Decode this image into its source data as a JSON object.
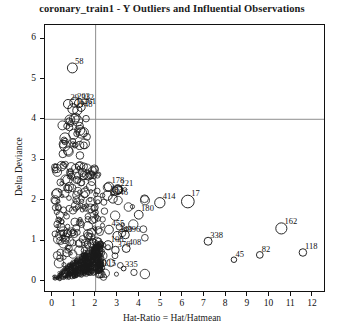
{
  "chart_data": {
    "type": "scatter",
    "title": "coronary_train1 - Y Outliers and Influential Observations",
    "xlabel": "Hat-Ratio = Hat/Hatmean",
    "ylabel": "Delta Deviance",
    "xlim": [
      -0.35,
      12.6
    ],
    "ylim": [
      -0.28,
      6.35
    ],
    "xticks": [
      0,
      1,
      2,
      3,
      4,
      5,
      6,
      7,
      8,
      9,
      10,
      11,
      12
    ],
    "yticks": [
      0,
      1,
      2,
      3,
      4,
      5,
      6
    ],
    "grid": false,
    "legend": "none",
    "marker": "open-circle",
    "reference_lines": [
      {
        "name": "hat-ratio-threshold",
        "orientation": "vertical",
        "value": 2,
        "color": "#8c8c8c"
      },
      {
        "name": "delta-deviance-threshold",
        "orientation": "horizontal",
        "value": 4,
        "color": "#8c8c8c"
      }
    ],
    "labeled_points": [
      {
        "label": "58",
        "x": 0.92,
        "y": 5.28,
        "r": 5.0
      },
      {
        "label": "29",
        "x": 0.72,
        "y": 4.38,
        "r": 4.6
      },
      {
        "label": "203",
        "x": 1.02,
        "y": 4.42,
        "r": 4.8
      },
      {
        "label": "312",
        "x": 1.22,
        "y": 4.4,
        "r": 4.4
      },
      {
        "label": "167",
        "x": 0.95,
        "y": 4.26,
        "r": 5.2
      },
      {
        "label": "148",
        "x": 1.15,
        "y": 4.22,
        "r": 4.6
      },
      {
        "label": "261",
        "x": 1.32,
        "y": 4.3,
        "r": 4.2
      },
      {
        "label": "178",
        "x": 2.62,
        "y": 2.32,
        "r": 4.6
      },
      {
        "label": "221",
        "x": 3.05,
        "y": 2.26,
        "r": 4.2
      },
      {
        "label": "133",
        "x": 2.55,
        "y": 2.1,
        "r": 4.8
      },
      {
        "label": "146",
        "x": 2.8,
        "y": 2.02,
        "r": 4.4
      },
      {
        "label": "180",
        "x": 4.0,
        "y": 1.62,
        "r": 4.4
      },
      {
        "label": "414",
        "x": 4.98,
        "y": 1.92,
        "r": 5.2
      },
      {
        "label": "17",
        "x": 6.28,
        "y": 1.95,
        "r": 6.4
      },
      {
        "label": "455",
        "x": 2.62,
        "y": 1.25,
        "r": 4.4
      },
      {
        "label": "396",
        "x": 3.38,
        "y": 1.12,
        "r": 4.0
      },
      {
        "label": "240",
        "x": 3.0,
        "y": 1.1,
        "r": 4.2
      },
      {
        "label": "108",
        "x": 2.58,
        "y": 0.86,
        "r": 4.6
      },
      {
        "label": "376",
        "x": 2.92,
        "y": 0.74,
        "r": 3.8
      },
      {
        "label": "408",
        "x": 3.42,
        "y": 0.78,
        "r": 4.0
      },
      {
        "label": "115",
        "x": 2.3,
        "y": 0.3,
        "r": 2.6
      },
      {
        "label": "335",
        "x": 3.3,
        "y": 0.28,
        "r": 2.4
      },
      {
        "label": "338",
        "x": 7.22,
        "y": 0.96,
        "r": 4.0
      },
      {
        "label": "162",
        "x": 10.62,
        "y": 1.28,
        "r": 5.6
      },
      {
        "label": "45",
        "x": 8.42,
        "y": 0.5,
        "r": 2.8
      },
      {
        "label": "82",
        "x": 9.62,
        "y": 0.62,
        "r": 3.4
      },
      {
        "label": "118",
        "x": 11.62,
        "y": 0.68,
        "r": 3.8
      }
    ]
  }
}
